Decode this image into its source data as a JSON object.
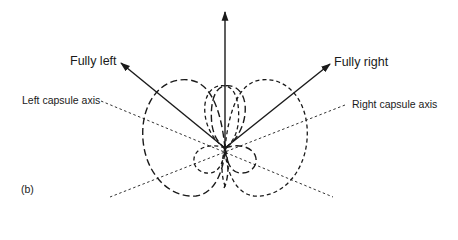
{
  "diagram": {
    "panel_label": "(b)",
    "arrows": {
      "fully_left": "Fully left",
      "fully_right": "Fully right",
      "vertical": ""
    },
    "axes": {
      "left_capsule": "Left capsule axis",
      "right_capsule": "Right capsule axis"
    },
    "colors": {
      "ink": "#1a1a1a",
      "background": "#ffffff"
    },
    "geometry": {
      "origin": [
        225,
        148
      ],
      "vertical_arrow_tip": [
        225,
        12
      ],
      "fully_left_tip": [
        121,
        63
      ],
      "fully_right_tip": [
        330,
        64
      ],
      "left_axis_ends": [
        [
          101,
          101
        ],
        [
          333,
          197
        ]
      ],
      "right_axis_ends": [
        [
          345,
          105
        ],
        [
          110,
          197
        ]
      ]
    }
  }
}
